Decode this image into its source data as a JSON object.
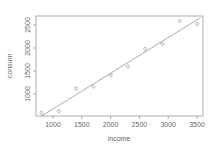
{
  "chart_data": {
    "type": "scatter",
    "title": "",
    "xlabel": "income",
    "ylabel": "consum",
    "xlim": [
      700,
      3600
    ],
    "ylim": [
      520,
      2680
    ],
    "x_ticks": [
      1000,
      1500,
      2000,
      2500,
      3000,
      3500
    ],
    "y_ticks": [
      1000,
      1500,
      2000,
      2500
    ],
    "grid": false,
    "legend": null,
    "points": [
      {
        "x": 800,
        "y": 590
      },
      {
        "x": 1100,
        "y": 630
      },
      {
        "x": 1400,
        "y": 1120
      },
      {
        "x": 1700,
        "y": 1160
      },
      {
        "x": 2000,
        "y": 1410
      },
      {
        "x": 2300,
        "y": 1600
      },
      {
        "x": 2600,
        "y": 1980
      },
      {
        "x": 2900,
        "y": 2090
      },
      {
        "x": 3200,
        "y": 2590
      },
      {
        "x": 3500,
        "y": 2520
      }
    ],
    "fit_line": {
      "x0": 800,
      "y0": 520,
      "x1": 3560,
      "y1": 2660
    },
    "colors": {
      "points": "#888888",
      "line": "#888888",
      "axes": "#888888",
      "text": "#666666"
    }
  }
}
